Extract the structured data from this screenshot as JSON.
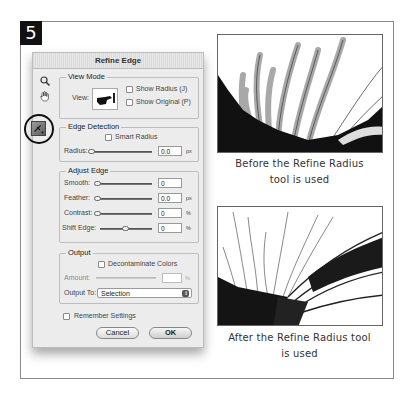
{
  "step_number": "5",
  "dialog": {
    "title": "Refine Edge",
    "tools": [
      {
        "name": "zoom-tool",
        "icon": "magnifier-icon"
      },
      {
        "name": "hand-tool",
        "icon": "hand-icon"
      }
    ],
    "view_mode": {
      "label": "View Mode",
      "view_label": "View:",
      "show_radius": {
        "label": "Show Radius (J)",
        "checked": false
      },
      "show_original": {
        "label": "Show Original (P)",
        "checked": false
      }
    },
    "edge_detection": {
      "label": "Edge Detection",
      "smart_radius": {
        "label": "Smart Radius",
        "checked": false
      },
      "radius": {
        "label": "Radius:",
        "value": "0.0",
        "unit": "px"
      }
    },
    "adjust_edge": {
      "label": "Adjust Edge",
      "smooth": {
        "label": "Smooth:",
        "value": "0",
        "unit": ""
      },
      "feather": {
        "label": "Feather:",
        "value": "0.0",
        "unit": "px"
      },
      "contrast": {
        "label": "Contrast:",
        "value": "0",
        "unit": "%"
      },
      "shift_edge": {
        "label": "Shift Edge:",
        "value": "0",
        "unit": "%"
      }
    },
    "output": {
      "label": "Output",
      "decontaminate": {
        "label": "Decontaminate Colors",
        "checked": false
      },
      "amount": {
        "label": "Amount:",
        "value": "",
        "unit": "%"
      },
      "output_to": {
        "label": "Output To:",
        "value": "Selection"
      }
    },
    "remember_settings": {
      "label": "Remember Settings",
      "checked": false
    },
    "buttons": {
      "cancel": "Cancel",
      "ok": "OK"
    }
  },
  "figures": [
    {
      "caption_line1": "Before the Refine Radius",
      "caption_line2": "tool is used"
    },
    {
      "caption_line1": "After the Refine Radius tool",
      "caption_line2": "is used"
    }
  ]
}
